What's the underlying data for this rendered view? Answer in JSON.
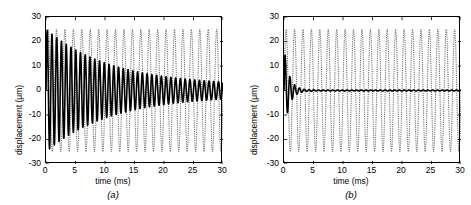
{
  "figure": {
    "panels": [
      {
        "id": "a",
        "label": "(a)",
        "xlabel": "time (ms)",
        "ylabel": "displacement (μm)",
        "xticks": [
          0,
          5,
          10,
          15,
          20,
          25,
          30
        ],
        "yticks": [
          -30,
          -20,
          -10,
          0,
          10,
          20,
          30
        ]
      },
      {
        "id": "b",
        "label": "(b)",
        "xlabel": "time (ms)",
        "ylabel": "displacement (μm)",
        "xticks": [
          0,
          5,
          10,
          15,
          20,
          25,
          30
        ],
        "yticks": [
          -30,
          -20,
          -10,
          0,
          10,
          20,
          30
        ]
      }
    ]
  },
  "chart_data": [
    {
      "type": "line",
      "panel": "a",
      "title": "",
      "xlabel": "time (ms)",
      "ylabel": "displacement (μm)",
      "xlim": [
        0,
        30
      ],
      "ylim": [
        -30,
        30
      ],
      "xticks": [
        0,
        5,
        10,
        15,
        20,
        25,
        30
      ],
      "yticks": [
        -30,
        -20,
        -10,
        0,
        10,
        20,
        30
      ],
      "grid": false,
      "legend": null,
      "series": [
        {
          "name": "lightly damped response",
          "style": "solid",
          "color": "#000000",
          "linewidth": 1.6,
          "model": "damped_sine",
          "amplitude": 25.0,
          "frequency_khz": 1.24,
          "decay_time_constant_ms": 11.0,
          "phase_rad": 0.0,
          "offset": 0.0,
          "final_amplitude": 2.0
        },
        {
          "name": "driving / undamped response",
          "style": "dashed",
          "color": "#1a1a1a",
          "linewidth": 0.7,
          "model": "steady_sine",
          "amplitude": 25.0,
          "frequency_khz": 0.7,
          "decay_time_constant_ms": null,
          "phase_rad": 0.0,
          "offset": 0.0
        }
      ]
    },
    {
      "type": "line",
      "panel": "b",
      "title": "",
      "xlabel": "time (ms)",
      "ylabel": "displacement (μm)",
      "xlim": [
        0,
        30
      ],
      "ylim": [
        -30,
        30
      ],
      "xticks": [
        0,
        5,
        10,
        15,
        20,
        25,
        30
      ],
      "yticks": [
        -30,
        -20,
        -10,
        0,
        10,
        20,
        30
      ],
      "grid": false,
      "legend": null,
      "series": [
        {
          "name": "heavily damped response",
          "style": "solid",
          "color": "#000000",
          "linewidth": 1.6,
          "model": "damped_sine",
          "amplitude": 18.0,
          "frequency_khz": 1.24,
          "decay_time_constant_ms": 0.85,
          "phase_rad": 0.0,
          "offset": 0.0,
          "final_amplitude": 0.2
        },
        {
          "name": "driving / undamped response",
          "style": "dashed",
          "color": "#1a1a1a",
          "linewidth": 0.7,
          "model": "steady_sine",
          "amplitude": 25.0,
          "frequency_khz": 0.7,
          "decay_time_constant_ms": null,
          "phase_rad": 0.0,
          "offset": 0.0
        }
      ]
    }
  ]
}
